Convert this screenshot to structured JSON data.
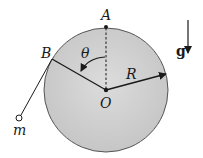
{
  "diagram": {
    "type": "physics-free-body",
    "labels": {
      "top_point": "A",
      "tangent_point": "B",
      "center": "O",
      "radius": "R",
      "angle": "θ",
      "mass": "m",
      "gravity": "g"
    },
    "colors": {
      "sphere_fill": "#cfcfcf",
      "sphere_stroke": "#555555",
      "line": "#1a1a1a",
      "background": "#ffffff"
    },
    "geometry": {
      "center": [
        106,
        90
      ],
      "radius": 62,
      "point_A": [
        106,
        28
      ],
      "point_B": [
        52,
        59
      ],
      "radius_tip": [
        166,
        74
      ],
      "mass_pos": [
        19,
        118
      ],
      "gravity_arrow": {
        "from": [
          188,
          20
        ],
        "to": [
          188,
          52
        ]
      }
    }
  }
}
